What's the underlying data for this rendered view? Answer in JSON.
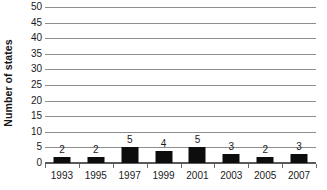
{
  "chart_data": {
    "type": "bar",
    "title": "",
    "xlabel": "",
    "ylabel": "Number of states",
    "categories": [
      "1993",
      "1995",
      "1997",
      "1999",
      "2001",
      "2003",
      "2005",
      "2007"
    ],
    "values": [
      2,
      2,
      5,
      4,
      5,
      3,
      2,
      3
    ],
    "data_labels": [
      "2",
      "2",
      "5",
      "4",
      "5",
      "3",
      "2",
      "3"
    ],
    "ylim": [
      0,
      50
    ],
    "ytick_step": 5,
    "yticks": [
      0,
      5,
      10,
      15,
      20,
      25,
      30,
      35,
      40,
      45,
      50
    ],
    "ytick_labels": [
      "0",
      "5",
      "10",
      "15",
      "20",
      "25",
      "30",
      "35",
      "40",
      "45",
      "50"
    ],
    "grid": true,
    "grid_axis": "y",
    "legend": false,
    "legend_position": "none",
    "bar_color": "#0d0d0d",
    "gridline_color": "#8e8e8e",
    "axis_color": "#5a5a5a",
    "background_color": "#ffffff"
  }
}
